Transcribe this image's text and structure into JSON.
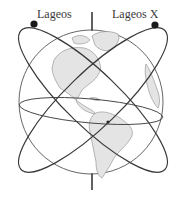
{
  "diagram": {
    "title": "",
    "satellites": [
      {
        "name": "Lageos",
        "label": "Lageos"
      },
      {
        "name": "Lageos X",
        "label": "Lageos X"
      }
    ],
    "elements": [
      "earth-globe",
      "rotation-axis",
      "equator",
      "orbit-lageos",
      "orbit-lageos-x"
    ]
  },
  "colors": {
    "line": "#3a3a3a",
    "land": "#e2e2e2",
    "land_outline": "#8a8a8a",
    "background": "#ffffff"
  }
}
